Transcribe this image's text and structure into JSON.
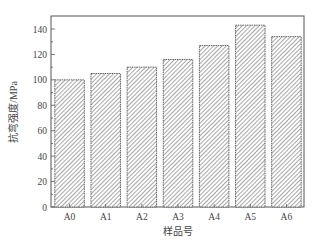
{
  "chart_data": {
    "type": "bar",
    "title": "",
    "xlabel": "样品号",
    "ylabel": "抗弯强度/MPa",
    "categories": [
      "A0",
      "A1",
      "A2",
      "A3",
      "A4",
      "A5",
      "A6"
    ],
    "values": [
      100,
      105,
      110,
      116,
      127,
      143,
      134
    ],
    "ylim": [
      0,
      150
    ],
    "yticks": [
      0,
      20,
      40,
      60,
      80,
      100,
      120,
      140
    ],
    "grid": false,
    "legend": null,
    "bar_fill": "hatched",
    "colors": {
      "bar_edge": "#555555",
      "hatch": "#777777",
      "axis": "#555555",
      "text": "#444444"
    }
  }
}
